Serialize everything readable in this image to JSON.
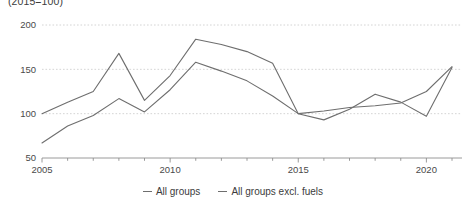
{
  "chart_data": {
    "type": "line",
    "title": "",
    "subtitle": "(2015=100)",
    "xlabel": "",
    "ylabel": "",
    "x": [
      2005,
      2006,
      2007,
      2008,
      2009,
      2010,
      2011,
      2012,
      2013,
      2014,
      2015,
      2016,
      2017,
      2018,
      2019,
      2020,
      2021
    ],
    "series": [
      {
        "name": "All groups",
        "values": [
          100,
          113,
          125,
          168,
          115,
          143,
          184,
          178,
          170,
          157,
          100,
          93,
          105,
          122,
          113,
          97,
          152
        ]
      },
      {
        "name": "All groups excl. fuels",
        "values": [
          67,
          86,
          98,
          117,
          102,
          127,
          158,
          148,
          137,
          120,
          100,
          103,
          107,
          109,
          112,
          125,
          153
        ]
      }
    ],
    "xlim": [
      2005,
      2021
    ],
    "ylim": [
      50,
      200
    ],
    "yticks": [
      50,
      100,
      150,
      200
    ],
    "ytick_labels": [
      "50",
      "100",
      "150",
      "200"
    ],
    "xticks": [
      2005,
      2010,
      2015,
      2020
    ],
    "xtick_labels": [
      "2005",
      "2010",
      "2015",
      "2020"
    ],
    "grid": true,
    "legend_position": "bottom",
    "series_color": "#6e6e6e",
    "grid_color": "#c9c9c9",
    "axis_color": "#8f8f8f",
    "text_color": "#3c3c3c"
  }
}
